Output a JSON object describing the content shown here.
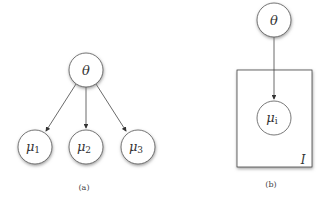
{
  "panel_a": {
    "caption": "(a)",
    "root": {
      "symbol": "θ"
    },
    "children": [
      {
        "symbol": "μ",
        "subscript": "1"
      },
      {
        "symbol": "μ",
        "subscript": "2"
      },
      {
        "symbol": "μ",
        "subscript": "3"
      }
    ]
  },
  "panel_b": {
    "caption": "(b)",
    "root": {
      "symbol": "θ"
    },
    "child": {
      "symbol": "μ",
      "subscript": "i"
    },
    "plate_label": "I"
  },
  "colors": {
    "stroke": "#555555",
    "fill": "#ffffff",
    "shadow": "#999999"
  }
}
